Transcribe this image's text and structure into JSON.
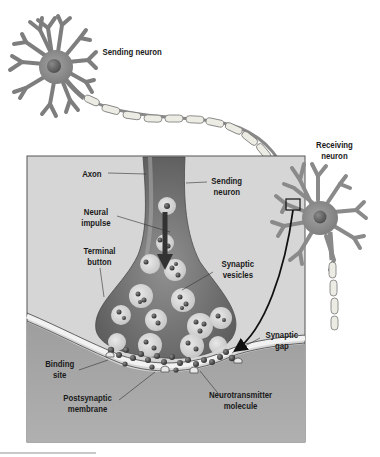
{
  "diagram": {
    "labels": {
      "sending_neuron_top": "Sending neuron",
      "receiving_neuron": [
        "Receiving",
        "neuron"
      ],
      "axon": "Axon",
      "sending_neuron_inset": [
        "Sending",
        "neuron"
      ],
      "neural_impulse": [
        "Neural",
        "impulse"
      ],
      "terminal_button": [
        "Terminal",
        "button"
      ],
      "synaptic_vesicles": [
        "Synaptic",
        "vesicles"
      ],
      "synaptic_gap": [
        "Synaptic",
        "gap"
      ],
      "binding_site": [
        "Binding",
        "site"
      ],
      "postsynaptic_membrane": [
        "Postsynaptic",
        "membrane"
      ],
      "neurotransmitter_molecule": [
        "Neurotransmitter",
        "molecule"
      ]
    },
    "colors": {
      "neuron_body": "#8c8c8c",
      "neuron_nucleus": "#5e5e5e",
      "myelin": "#ecece4",
      "inset_background": "#d6d6d6",
      "postsynaptic_region": "#a8a8a8",
      "terminal_button": "#7a7a7a",
      "vesicle": "#e8e8e8",
      "molecule": "#3a3a3a",
      "leader_line": "#333333",
      "arrow": "#111111"
    }
  }
}
